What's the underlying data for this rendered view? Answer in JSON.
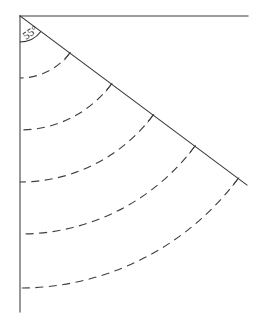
{
  "diagram": {
    "background_color": "#ffffff",
    "line_color": "#3a3a3a",
    "arc_color": "#3f3f3f",
    "label_color": "#1c1c1c",
    "angle_label": {
      "value": "55",
      "degree_symbol": "°",
      "text": "55°",
      "position_x": 26,
      "position_y": 40,
      "rotation_deg": -35
    },
    "vertex": {
      "x": 20,
      "y": 16
    },
    "rays": [
      {
        "name": "horizontal-ray",
        "from_x": 20,
        "from_y": 16,
        "to_x": 248,
        "to_y": 16,
        "direction_deg": 0
      },
      {
        "name": "vertical-ray",
        "from_x": 20,
        "from_y": 16,
        "to_x": 20,
        "to_y": 312,
        "direction_deg": 90
      },
      {
        "name": "diagonal-ray",
        "from_x": 20,
        "from_y": 16,
        "to_x": 247,
        "to_y": 185,
        "direction_deg": 36.7
      }
    ],
    "angle_marker": {
      "radius": 26,
      "start_deg": 36.7,
      "end_deg": 90
    },
    "arcs": [
      {
        "name": "arc-1",
        "radius": 62,
        "vertical_crossing_y": 78
      },
      {
        "name": "arc-2",
        "radius": 114,
        "vertical_crossing_y": 130
      },
      {
        "name": "arc-3",
        "radius": 166,
        "vertical_crossing_y": 182
      },
      {
        "name": "arc-4",
        "radius": 218,
        "vertical_crossing_y": 234
      },
      {
        "name": "arc-5",
        "radius": 272,
        "vertical_crossing_y": 288
      }
    ],
    "arc_sweep": {
      "start_deg": 36.7,
      "end_deg": 90,
      "dash_pattern": "8 5.5"
    },
    "tick_length": 9
  }
}
